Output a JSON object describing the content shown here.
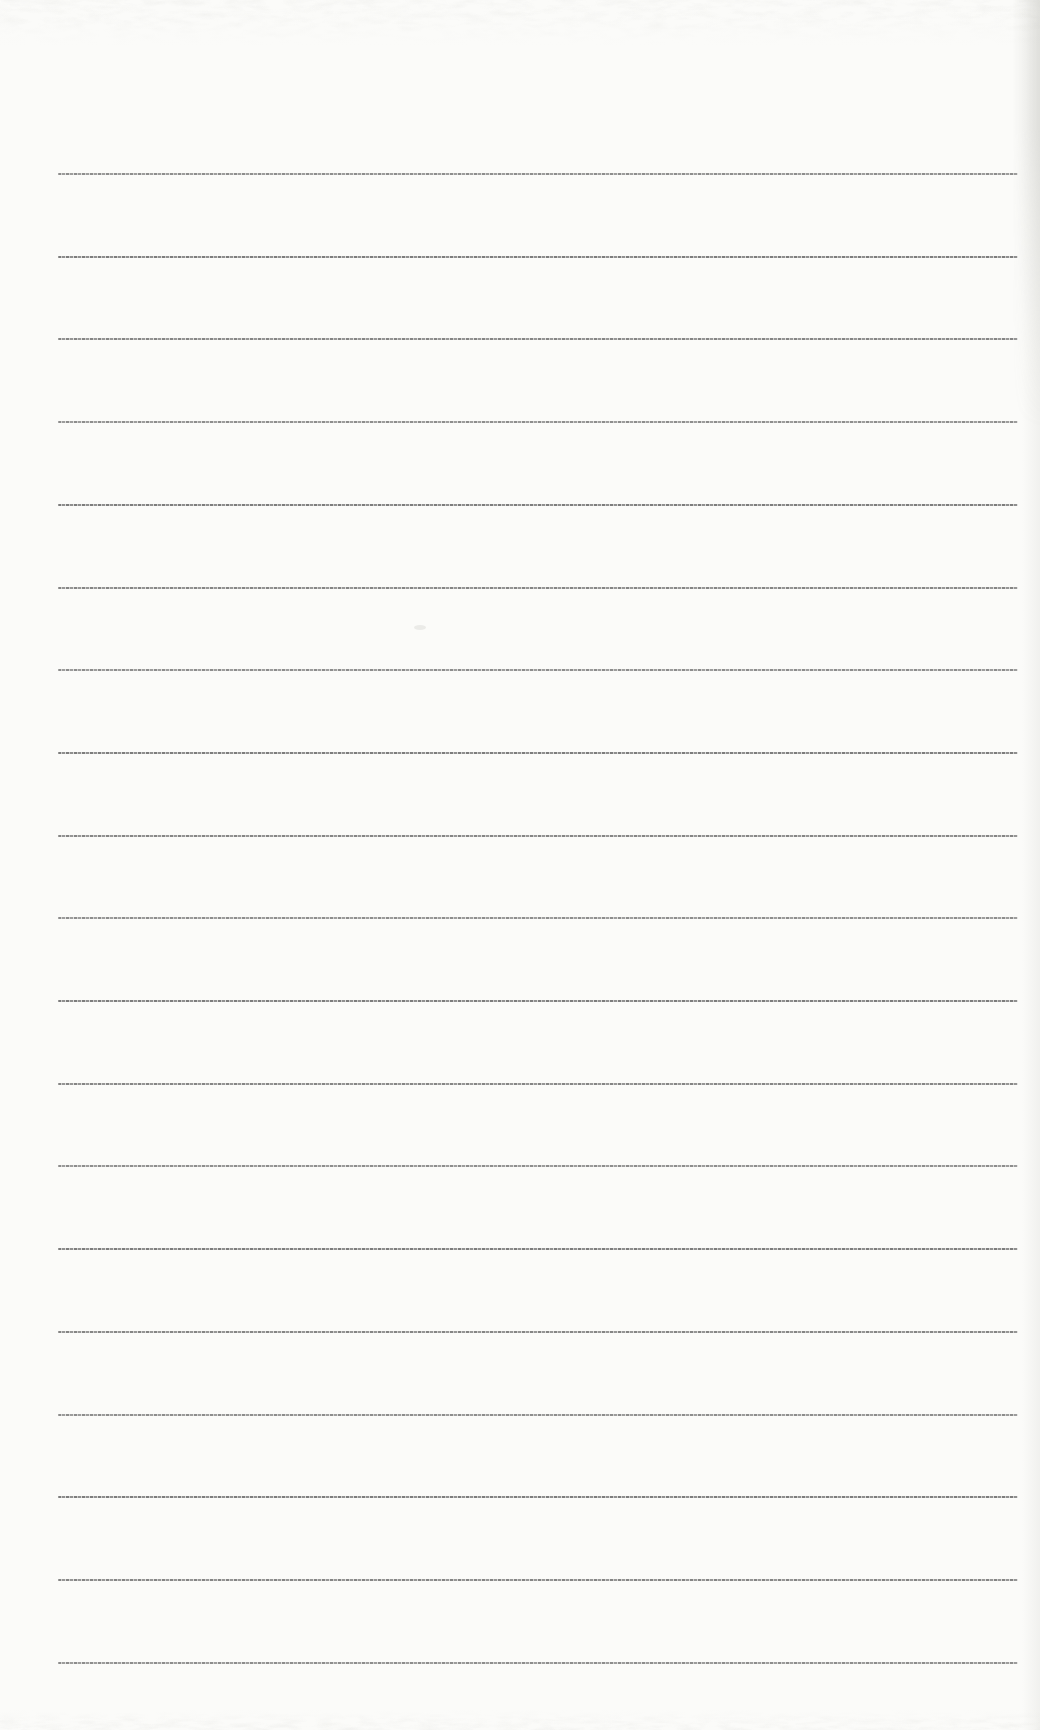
{
  "page": {
    "kind": "scanned-blank-ruled-notebook-page",
    "width_px": 1040,
    "height_px": 1730,
    "background_color": "#fbfbf9"
  },
  "ruled_lines": {
    "count": 19,
    "first_line_y_px": 173,
    "line_spacing_px": 82.7,
    "left_x_px": 58,
    "right_x_px": 1018,
    "thickness_px": 2,
    "color": "#8c8c8c"
  },
  "scan_artifacts": {
    "top_noise_band_height_px": 46,
    "bottom_noise_band_height_px": 20,
    "noise_color": "#dededa",
    "right_edge_shade_color": "#c9c9c4",
    "smudge": {
      "x_px": 414,
      "y_px": 625,
      "width_px": 12,
      "height_px": 5
    }
  }
}
